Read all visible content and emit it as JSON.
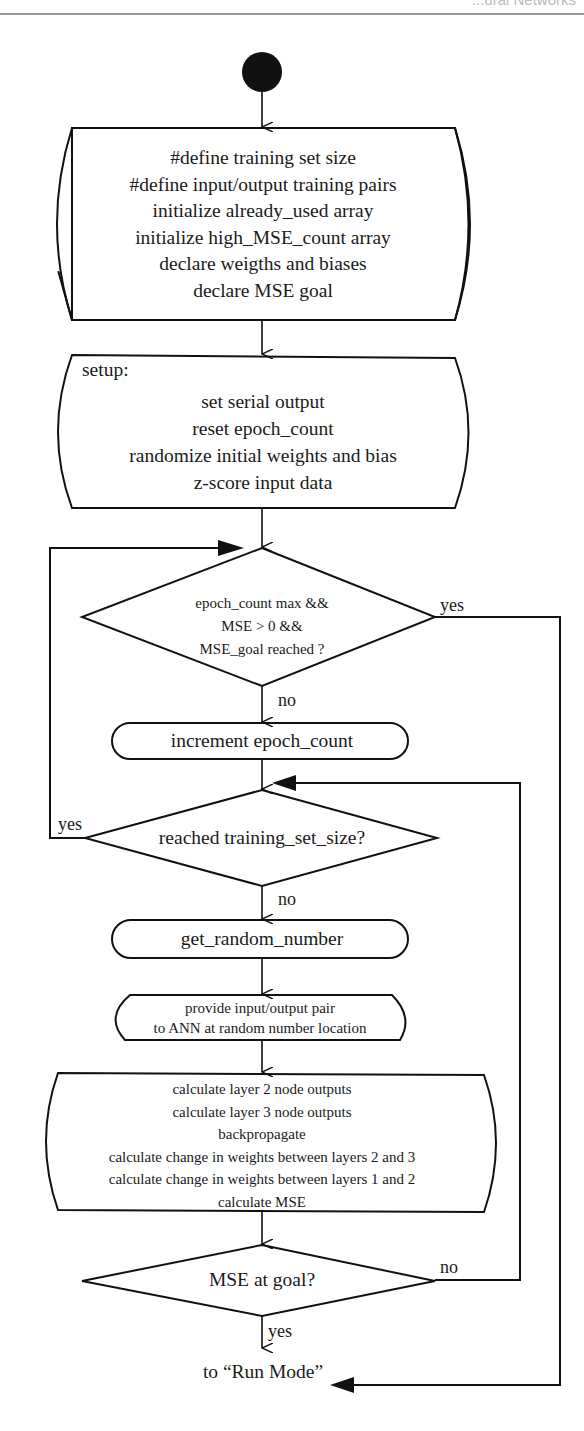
{
  "header": {
    "running_title": "...ural Networks"
  },
  "flowchart": {
    "start_node": "start",
    "init_block": {
      "lines": [
        "#define training set size",
        "#define input/output training pairs",
        "initialize already_used array",
        "initialize high_MSE_count array",
        "declare weigths and biases",
        "declare MSE goal"
      ]
    },
    "setup_block": {
      "title": "setup:",
      "lines": [
        "set serial output",
        "reset epoch_count",
        "randomize initial weights and bias",
        "z-score input data"
      ]
    },
    "decision_epoch": {
      "lines": [
        "epoch_count max  &&",
        "MSE > 0  &&",
        "MSE_goal reached ?"
      ],
      "yes_label": "yes",
      "no_label": "no"
    },
    "increment_block": {
      "label": "increment epoch_count"
    },
    "decision_training_set": {
      "label": "reached training_set_size?",
      "yes_label": "yes",
      "no_label": "no"
    },
    "random_block": {
      "label": "get_random_number"
    },
    "provide_block": {
      "lines": [
        "provide input/output pair",
        "to ANN at random number location"
      ]
    },
    "calc_block": {
      "lines": [
        "calculate layer 2 node outputs",
        "calculate layer 3 node outputs",
        "backpropagate",
        "calculate change in weights between layers 2 and 3",
        "calculate change in weights between layers 1 and 2",
        "calculate MSE"
      ]
    },
    "decision_mse": {
      "label": "MSE at goal?",
      "no_label": "no",
      "yes_label": "yes"
    },
    "exit_label": "to “Run Mode”"
  },
  "colors": {
    "stroke": "#111111",
    "background": "#ffffff",
    "header_rule": "#9a9a9a"
  }
}
